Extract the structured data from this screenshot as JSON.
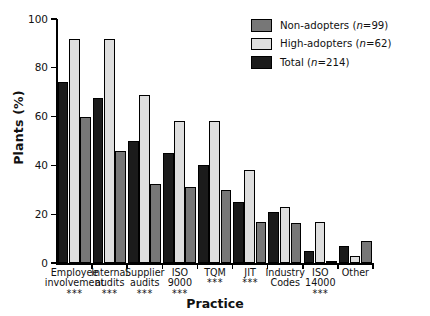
{
  "chart_data": {
    "type": "bar",
    "title": "",
    "xlabel": "Practice",
    "ylabel": "Plants (%)",
    "ylim": [
      0,
      100
    ],
    "yticks": [
      0,
      20,
      40,
      60,
      80,
      100
    ],
    "ytick_labels": [
      "0",
      "20",
      "40",
      "60",
      "80",
      "100"
    ],
    "grid": false,
    "legend_position": "top-right",
    "categories": [
      "Employee involvement",
      "Internal audits",
      "Supplier audits",
      "ISO 9000",
      "TQM",
      "JIT",
      "Industry Codes",
      "ISO 14000",
      "Other"
    ],
    "category_lines": [
      [
        "Employee",
        "involvement"
      ],
      [
        "Internal",
        "audits"
      ],
      [
        "Supplier",
        "audits"
      ],
      [
        "ISO",
        "9000"
      ],
      [
        "TQM"
      ],
      [
        "JIT"
      ],
      [
        "Industry",
        "Codes"
      ],
      [
        "ISO",
        "14000"
      ],
      [
        "Other"
      ]
    ],
    "significance": [
      "***",
      "***",
      "***",
      "***",
      "***",
      "***",
      "",
      "***",
      ""
    ],
    "series": [
      {
        "name": "Total (n=214)",
        "key": "total",
        "color": "#1b1b1b",
        "values": [
          74,
          67.5,
          50,
          45,
          40,
          25,
          21,
          5,
          7
        ]
      },
      {
        "name": "High-adopters (n=62)",
        "key": "high",
        "color": "#dedede",
        "values": [
          92,
          92,
          69,
          58,
          58,
          38,
          23,
          17,
          3
        ]
      },
      {
        "name": "Non-adopters (n=99)",
        "key": "non",
        "color": "#777777",
        "values": [
          60,
          46,
          32.5,
          31,
          30,
          17,
          16.5,
          1,
          9
        ]
      }
    ]
  },
  "legend": {
    "items": [
      {
        "label": "Non-adopters",
        "n_prefix": " (",
        "n_label": "n",
        "n_value": "=99)",
        "color": "#777777",
        "key": "non"
      },
      {
        "label": "High-adopters",
        "n_prefix": " (",
        "n_label": "n",
        "n_value": "=62)",
        "color": "#dedede",
        "key": "high"
      },
      {
        "label": "Total",
        "n_prefix": " (",
        "n_label": "n",
        "n_value": "=214)",
        "color": "#1b1b1b",
        "key": "total"
      }
    ]
  },
  "axes": {
    "y_title": "Plants (%)",
    "x_title": "Practice"
  }
}
